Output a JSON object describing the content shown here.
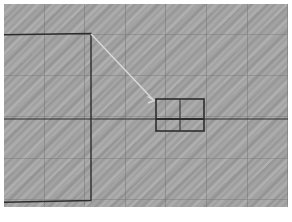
{
  "document": {
    "title": "Detail Callout Drawing",
    "background_color": "#a3a3a3",
    "page_color": "#ffffff",
    "line_color": "#2d2d2d",
    "grid_color": "#787878",
    "leader_color": "#d8d8d8",
    "caption_mark_color": "#9a9a9a"
  },
  "viewport": {
    "x": 4,
    "y": 4,
    "width": 284,
    "height": 203,
    "grid_spacing_x": 41,
    "grid_spacing_y": 41,
    "grid_visible": "true",
    "texture": "diagonal-moire"
  },
  "shapes": {
    "main_rectangle": {
      "name": "main-outline",
      "left": -10,
      "top": 30,
      "right": 87,
      "bottom": 196,
      "stroke_width": 1.4,
      "note": "clipped at left edge of viewport"
    },
    "centerline": {
      "name": "horizontal-centerline",
      "y": 115,
      "x_start": 0,
      "x_end": 284,
      "stroke_width": 1.2
    },
    "detail_rectangle": {
      "name": "detail-view",
      "left": 152,
      "top": 95,
      "right": 200,
      "bottom": 127,
      "stroke_width": 1.6,
      "vertical_divider_x": 176,
      "horizontal_divider_y": 115
    },
    "leader_line": {
      "name": "detail-leader",
      "from_x": 87,
      "from_y": 30,
      "to_x": 150,
      "to_y": 96,
      "stroke_width": 1.5,
      "arrowhead": "true"
    }
  },
  "labels": {
    "caption": ""
  }
}
